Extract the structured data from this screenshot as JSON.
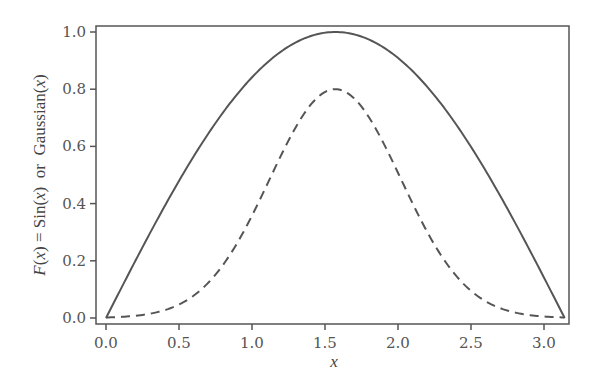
{
  "chart_data": {
    "type": "line",
    "title": "",
    "xlabel": "x",
    "ylabel": {
      "parts": [
        "F",
        "(",
        "x",
        ") = Sin(",
        "x",
        ")  or  Gaussian(",
        "x",
        ")"
      ]
    },
    "xlim": [
      -0.07,
      3.23
    ],
    "ylim": [
      -0.02,
      1.03
    ],
    "x_ticks": [
      0.0,
      0.5,
      1.0,
      1.5,
      2.0,
      2.5,
      3.0
    ],
    "x_tick_labels": [
      "0.0",
      "0.5",
      "1.0",
      "1.5",
      "2.0",
      "2.5",
      "3.0"
    ],
    "y_ticks": [
      0.0,
      0.2,
      0.4,
      0.6,
      0.8,
      1.0
    ],
    "y_tick_labels": [
      "0.0",
      "0.2",
      "0.4",
      "0.6",
      "0.8",
      "1.0"
    ],
    "grid": false,
    "legend": null,
    "x": [
      0.0,
      0.157,
      0.314,
      0.471,
      0.628,
      0.785,
      0.942,
      1.1,
      1.257,
      1.414,
      1.571,
      1.728,
      1.885,
      2.042,
      2.199,
      2.356,
      2.513,
      2.67,
      2.827,
      2.985,
      3.142
    ],
    "series": [
      {
        "name": "Sin(x)",
        "style": "solid",
        "color": "#555555",
        "values": [
          0.0,
          0.156,
          0.309,
          0.454,
          0.588,
          0.707,
          0.809,
          0.891,
          0.951,
          0.988,
          1.0,
          0.988,
          0.951,
          0.891,
          0.809,
          0.707,
          0.588,
          0.454,
          0.309,
          0.156,
          0.0
        ]
      },
      {
        "name": "Gaussian(x)",
        "style": "dashed",
        "color": "#555555",
        "values": [
          0.002,
          0.006,
          0.015,
          0.033,
          0.068,
          0.13,
          0.226,
          0.358,
          0.52,
          0.686,
          0.8,
          0.686,
          0.52,
          0.358,
          0.226,
          0.13,
          0.068,
          0.033,
          0.015,
          0.006,
          0.002
        ]
      }
    ],
    "functions": {
      "sin": {
        "amplitude": 1.0
      },
      "gaussian": {
        "amplitude": 0.8,
        "mean": 1.5708,
        "sigma": 0.45
      }
    }
  },
  "colors": {
    "axis": "#555555",
    "line": "#555555",
    "text": "#555555",
    "background": "#ffffff"
  }
}
